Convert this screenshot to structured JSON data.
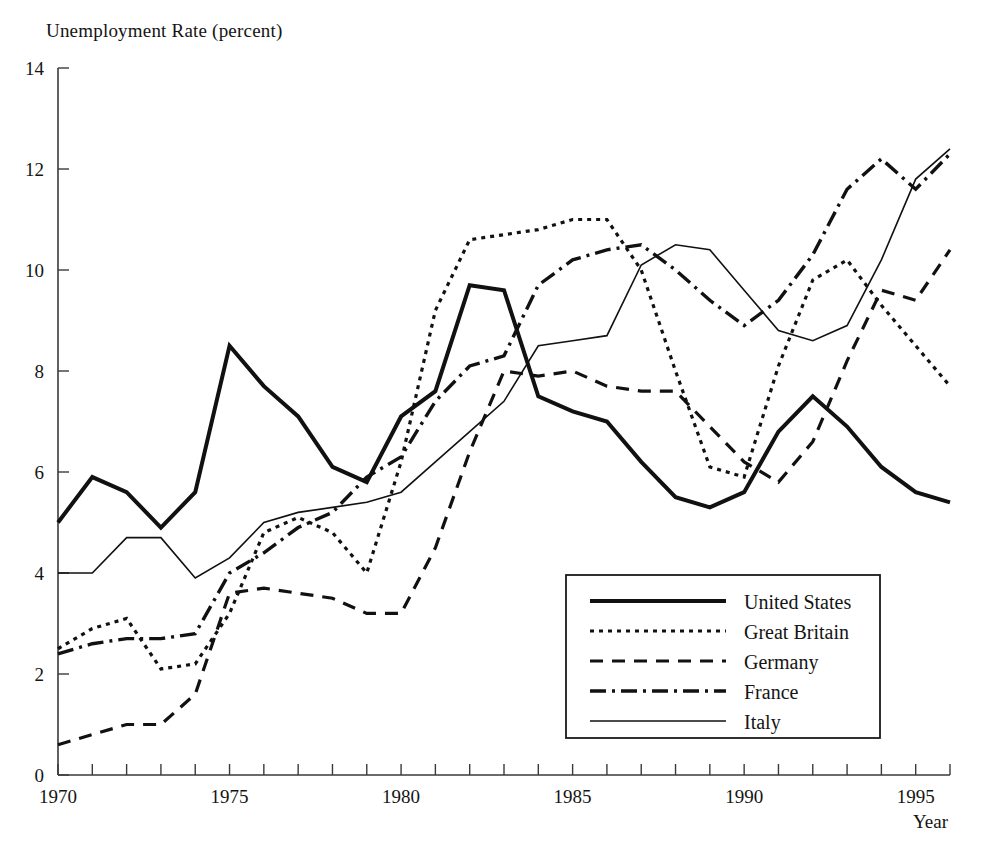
{
  "chart_data": {
    "type": "line",
    "title": "Unemployment Rate (percent)",
    "xlabel": "Year",
    "ylabel": "Unemployment Rate (percent)",
    "xlim": [
      1970,
      1996
    ],
    "ylim": [
      0,
      14
    ],
    "xticks": [
      1970,
      1971,
      1972,
      1973,
      1974,
      1975,
      1976,
      1977,
      1978,
      1979,
      1980,
      1981,
      1982,
      1983,
      1984,
      1985,
      1986,
      1987,
      1988,
      1989,
      1990,
      1991,
      1992,
      1993,
      1994,
      1995,
      1996
    ],
    "xtick_labels": [
      "1970",
      "",
      "",
      "",
      "",
      "1975",
      "",
      "",
      "",
      "",
      "1980",
      "",
      "",
      "",
      "",
      "1985",
      "",
      "",
      "",
      "",
      "1990",
      "",
      "",
      "",
      "",
      "1995",
      ""
    ],
    "yticks": [
      0,
      2,
      4,
      6,
      8,
      10,
      12,
      14
    ],
    "ytick_labels": [
      "0",
      "2",
      "4",
      "6",
      "8",
      "10",
      "12",
      "14"
    ],
    "grid": false,
    "legend_position": "bottom-right",
    "x": [
      1970,
      1971,
      1972,
      1973,
      1974,
      1975,
      1976,
      1977,
      1978,
      1979,
      1980,
      1981,
      1982,
      1983,
      1984,
      1985,
      1986,
      1987,
      1988,
      1989,
      1990,
      1991,
      1992,
      1993,
      1994,
      1995,
      1996
    ],
    "series": [
      {
        "name": "United States",
        "style": "solid-thick",
        "stroke_width": 4.0,
        "dasharray": "",
        "values": [
          5.0,
          5.9,
          5.6,
          4.9,
          5.6,
          8.5,
          7.7,
          7.1,
          6.1,
          5.8,
          7.1,
          7.6,
          9.7,
          9.6,
          7.5,
          7.2,
          7.0,
          6.2,
          5.5,
          5.3,
          5.6,
          6.8,
          7.5,
          6.9,
          6.1,
          5.6,
          5.4
        ]
      },
      {
        "name": "Great Britain",
        "style": "dotted",
        "stroke_width": 3.2,
        "dasharray": "4 5",
        "values": [
          2.5,
          2.9,
          3.1,
          2.1,
          2.2,
          3.2,
          4.8,
          5.1,
          4.8,
          4.0,
          6.2,
          9.2,
          10.6,
          10.7,
          10.8,
          11.0,
          11.0,
          10.0,
          8.0,
          6.1,
          5.9,
          8.1,
          9.8,
          10.2,
          9.3,
          8.5,
          7.7
        ]
      },
      {
        "name": "Germany",
        "style": "dashed",
        "stroke_width": 3.2,
        "dasharray": "13 9",
        "values": [
          0.6,
          0.8,
          1.0,
          1.0,
          1.6,
          3.6,
          3.7,
          3.6,
          3.5,
          3.2,
          3.2,
          4.5,
          6.4,
          8.0,
          7.9,
          8.0,
          7.7,
          7.6,
          7.6,
          6.9,
          6.2,
          5.8,
          6.6,
          8.2,
          9.6,
          9.4,
          10.4
        ]
      },
      {
        "name": "France",
        "style": "dash-dot",
        "stroke_width": 3.4,
        "dasharray": "16 6 3 6",
        "values": [
          2.4,
          2.6,
          2.7,
          2.7,
          2.8,
          4.0,
          4.4,
          4.9,
          5.2,
          5.9,
          6.3,
          7.4,
          8.1,
          8.3,
          9.7,
          10.2,
          10.4,
          10.5,
          10.0,
          9.4,
          8.9,
          9.4,
          10.3,
          11.6,
          12.2,
          11.6,
          12.3
        ]
      },
      {
        "name": "Italy",
        "style": "solid-thin",
        "stroke_width": 1.6,
        "dasharray": "",
        "values": [
          4.0,
          4.0,
          4.7,
          4.7,
          3.9,
          4.3,
          5.0,
          5.2,
          5.3,
          5.4,
          5.6,
          6.2,
          6.8,
          7.4,
          8.5,
          8.6,
          8.7,
          10.1,
          10.5,
          10.4,
          9.6,
          8.8,
          8.6,
          8.9,
          10.2,
          11.8,
          12.4
        ]
      }
    ],
    "legend": [
      {
        "label": "United States",
        "style": "solid-thick"
      },
      {
        "label": "Great Britain",
        "style": "dotted"
      },
      {
        "label": "Germany",
        "style": "dashed"
      },
      {
        "label": "France",
        "style": "dash-dot"
      },
      {
        "label": "Italy",
        "style": "solid-thin"
      }
    ]
  }
}
